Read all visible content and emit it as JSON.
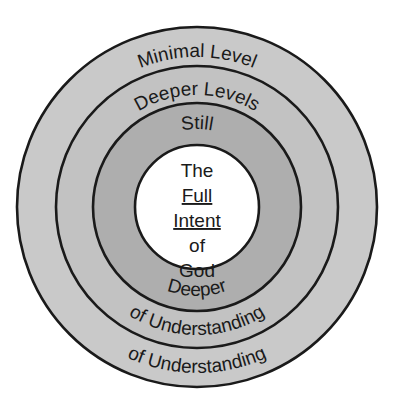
{
  "diagram": {
    "type": "concentric-rings",
    "geometry": {
      "center_x": 197,
      "center_y": 207,
      "ring_radii": [
        180,
        141,
        104,
        62
      ]
    },
    "colors": {
      "background": "#ffffff",
      "ring_1_outer": "#c9c9c9",
      "ring_2": "#c2c2c2",
      "ring_3": "#aeaeae",
      "ring_4_core": "#ffffff",
      "stroke": "#1a1a1a",
      "text": "#1a1a1a"
    },
    "rings": [
      {
        "id": "ring-outer",
        "index": 1,
        "fill": "#c9c9c9",
        "top_label": "Minimal Level",
        "bottom_label": "of Understanding"
      },
      {
        "id": "ring-second",
        "index": 2,
        "fill": "#c2c2c2",
        "top_label": "Deeper Levels",
        "bottom_label": "of Understanding"
      },
      {
        "id": "ring-third",
        "index": 3,
        "fill": "#aeaeae",
        "top_label": "Still",
        "bottom_label": "Deeper"
      },
      {
        "id": "ring-core",
        "index": 4,
        "fill": "#ffffff",
        "top_label": "",
        "bottom_label": ""
      }
    ],
    "center": {
      "lines": [
        {
          "text": "The",
          "underline": false
        },
        {
          "text": "Full",
          "underline": true
        },
        {
          "text": "Intent",
          "underline": true
        },
        {
          "text": "of",
          "underline": false
        },
        {
          "text": "God",
          "underline": false
        }
      ]
    }
  }
}
